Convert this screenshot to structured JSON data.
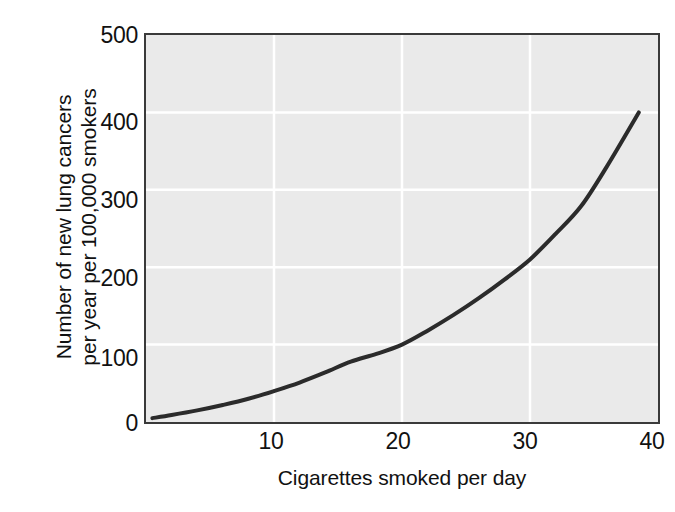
{
  "chart_data": {
    "type": "line",
    "title": "",
    "xlabel": "Cigarettes smoked per day",
    "ylabel": "Number of new lung cancers per year per 100,000 smokers",
    "ylabel_lines": [
      "Number of new lung cancers",
      "per year per 100,000 smokers"
    ],
    "xlim": [
      0,
      40
    ],
    "ylim": [
      0,
      500
    ],
    "xticks": [
      10,
      20,
      30,
      40
    ],
    "yticks": [
      0,
      100,
      200,
      300,
      400,
      500
    ],
    "xtick_labels": [
      "10",
      "20",
      "30",
      "40"
    ],
    "ytick_labels": [
      "0",
      "100",
      "200",
      "300",
      "400",
      "500"
    ],
    "grid": true,
    "grid_color": "#ffffff",
    "plot_background": "#eaeaea",
    "frame_color": "#3a3a3a",
    "legend": null,
    "legend_position": "none",
    "series": [
      {
        "name": "New lung cancers per 100,000 smokers",
        "color": "#2b2b2b",
        "line_width": 4,
        "x": [
          0.5,
          2,
          4,
          6,
          8,
          10,
          12,
          14,
          16,
          18,
          20,
          22,
          24,
          26,
          28,
          30,
          32,
          34,
          36,
          38.5
        ],
        "values": [
          5,
          9,
          15,
          22,
          30,
          40,
          51,
          64,
          78,
          88,
          100,
          118,
          138,
          160,
          184,
          210,
          243,
          279,
          330,
          400
        ]
      }
    ],
    "annotations": []
  },
  "axes": {
    "y_title_line1": "Number of new lung cancers",
    "y_title_line2": "per year per 100,000 smokers",
    "x_title": "Cigarettes smoked per day"
  },
  "ticks": {
    "y": [
      "500",
      "400",
      "300",
      "200",
      "100",
      "0"
    ],
    "x": [
      "10",
      "20",
      "30",
      "40"
    ]
  },
  "colors": {
    "curve": "#2b2b2b",
    "plot_bg": "#eaeaea",
    "grid": "#ffffff",
    "frame": "#3a3a3a",
    "text": "#111111",
    "page_bg": "#ffffff"
  }
}
